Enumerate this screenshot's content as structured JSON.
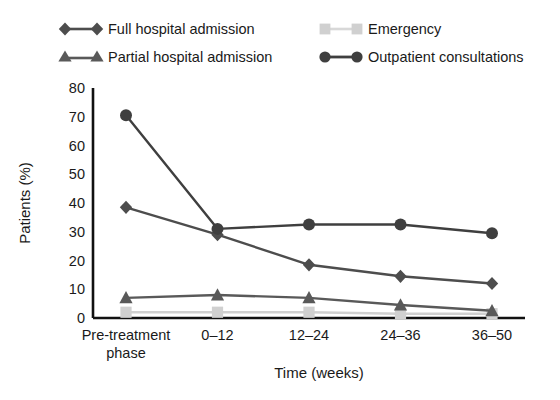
{
  "chart_data": {
    "type": "line",
    "title": "",
    "xlabel": "Time (weeks)",
    "ylabel": "Patients (%)",
    "categories": [
      "Pre-treatment phase",
      "0–12",
      "12–24",
      "24–36",
      "36–50"
    ],
    "category_lines": [
      [
        "Pre-treatment",
        "phase"
      ],
      [
        "0–12"
      ],
      [
        "12–24"
      ],
      [
        "24–36"
      ],
      [
        "36–50"
      ]
    ],
    "ylim": [
      0,
      80
    ],
    "yticks": [
      0,
      10,
      20,
      30,
      40,
      50,
      60,
      70,
      80
    ],
    "ytick_labels": [
      "0",
      "10",
      "20",
      "30",
      "40",
      "50",
      "60",
      "70",
      "80"
    ],
    "grid": false,
    "legend_position": "top",
    "series": [
      {
        "name": "Full hospital admission",
        "marker": "diamond",
        "color": "#4d4d4d",
        "values": [
          38.5,
          29,
          18.5,
          14.5,
          12
        ]
      },
      {
        "name": "Partial hospital admission",
        "marker": "triangle",
        "color": "#595959",
        "values": [
          7,
          8,
          7,
          4.5,
          2.5
        ]
      },
      {
        "name": "Emergency",
        "marker": "square",
        "color": "#d0d0d0",
        "values": [
          2,
          2,
          2,
          1.5,
          1.5
        ]
      },
      {
        "name": "Outpatient consultations",
        "marker": "circle",
        "color": "#3f3f3f",
        "values": [
          70.5,
          31,
          32.5,
          32.5,
          29.5
        ]
      }
    ]
  },
  "legend": {
    "items": [
      {
        "label": "Full hospital admission",
        "marker": "diamond",
        "color": "#4d4d4d"
      },
      {
        "label": "Partial hospital admission",
        "marker": "triangle",
        "color": "#595959"
      },
      {
        "label": "Emergency",
        "marker": "square",
        "color": "#d0d0d0"
      },
      {
        "label": "Outpatient consultations",
        "marker": "circle",
        "color": "#3f3f3f"
      }
    ]
  },
  "axes": {
    "y_title": "Patients (%)",
    "x_title": "Time (weeks)",
    "axis_color": "#111111"
  }
}
